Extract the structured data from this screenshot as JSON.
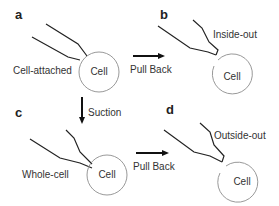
{
  "panels": {
    "a": {
      "letter": "a",
      "label": "Cell-attached",
      "cell": "Cell"
    },
    "b": {
      "letter": "b",
      "label": "Inside-out",
      "cell": "Cell"
    },
    "c": {
      "letter": "c",
      "label": "Whole-cell",
      "cell": "Cell"
    },
    "d": {
      "letter": "d",
      "label": "Outside-out",
      "cell": "Cell"
    }
  },
  "arrows": {
    "top": "Pull Back",
    "bottom": "Pull Back",
    "vertical": "Suction"
  },
  "colors": {
    "line": "#222222",
    "circle": "#999999",
    "text": "#333333"
  }
}
